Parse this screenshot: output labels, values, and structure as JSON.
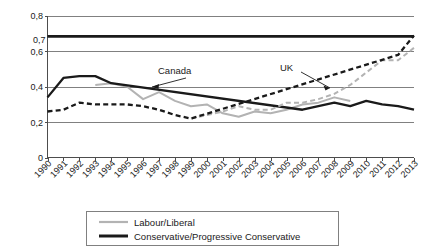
{
  "chart_data": {
    "type": "line",
    "title": "",
    "subtitle": "",
    "xlabel": "",
    "ylabel": "",
    "ylim": [
      0,
      0.8
    ],
    "xlim": [
      1990,
      2013
    ],
    "grid": true,
    "y_ticks": [
      "0",
      "0,2",
      "0,4",
      "0,6",
      "0,8"
    ],
    "y_tick_values": [
      0,
      0.2,
      0.4,
      0.6,
      0.8
    ],
    "categories": [
      "1990",
      "1991",
      "1992",
      "1993",
      "1994",
      "1995",
      "1996",
      "1997",
      "1998",
      "1999",
      "2000",
      "2001",
      "2002",
      "2003",
      "2004",
      "2005",
      "2006",
      "2007",
      "2008",
      "2009",
      "2010",
      "2011",
      "2012",
      "2013"
    ],
    "legend_position": "bottom",
    "legend": [
      {
        "label": "Labour/Liberal",
        "color": "#b3b3b3",
        "dash": "none"
      },
      {
        "label": "Conservative/Progressive Conservative",
        "color": "#1a1a1a",
        "dash": "none"
      }
    ],
    "annotations": [
      {
        "text": "Canada",
        "target_year": 2000,
        "target_value": 0.4
      },
      {
        "text": "UK",
        "target_year": 2008,
        "target_value": 0.35
      },
      {
        "text": "0,7",
        "target_year": 1990,
        "target_value": 0.69
      }
    ],
    "series": [
      {
        "name": "Canada Labour/Liberal",
        "country": "Canada",
        "party": "Labour/Liberal",
        "color": "#b3b3b3",
        "dash": "none",
        "x": [
          1993,
          1994,
          1995,
          1996,
          1997,
          1998,
          1999,
          2000,
          2001,
          2002,
          2003,
          2004,
          2005,
          2006,
          2007,
          2008,
          2009
        ],
        "values": [
          0.41,
          0.42,
          0.4,
          0.33,
          0.37,
          0.32,
          0.29,
          0.3,
          0.25,
          0.23,
          0.26,
          0.25,
          0.27,
          0.3,
          0.31,
          0.34,
          0.32
        ]
      },
      {
        "name": "Canada Conservative/Progressive Conservative",
        "country": "Canada",
        "party": "Conservative/Progressive Conservative",
        "color": "#1a1a1a",
        "dash": "none",
        "x": [
          1990,
          1991,
          1992,
          1993,
          1994,
          2006,
          2007,
          2008,
          2009,
          2010,
          2011,
          2012,
          2013
        ],
        "values": [
          0.34,
          0.45,
          0.46,
          0.46,
          0.42,
          0.27,
          0.29,
          0.31,
          0.29,
          0.32,
          0.3,
          0.29,
          0.27
        ]
      },
      {
        "name": "UK Labour/Liberal",
        "country": "UK",
        "party": "Labour/Liberal",
        "color": "#b3b3b3",
        "dash": "dashed",
        "x": [
          1999,
          2000,
          2001,
          2002,
          2003,
          2004,
          2005,
          2006,
          2007,
          2008,
          2009,
          2010,
          2011,
          2012,
          2013
        ],
        "values": [
          0.22,
          0.24,
          0.26,
          0.29,
          0.27,
          0.27,
          0.31,
          0.31,
          0.33,
          0.36,
          0.41,
          0.48,
          0.55,
          0.55,
          0.62
        ]
      },
      {
        "name": "UK Conservative/Progressive Conservative",
        "country": "UK",
        "party": "Conservative/Progressive Conservative",
        "color": "#1a1a1a",
        "dash": "dashed",
        "x": [
          1990,
          1991,
          1992,
          1993,
          1994,
          1995,
          1996,
          1997,
          1998,
          1999,
          2012,
          2013
        ],
        "values": [
          0.26,
          0.27,
          0.31,
          0.3,
          0.3,
          0.3,
          0.29,
          0.27,
          0.24,
          0.22,
          0.58,
          0.69
        ]
      },
      {
        "name": "Reference line 0,7",
        "country": "",
        "party": "reference",
        "color": "#1a1a1a",
        "dash": "none",
        "x": [
          1990,
          2013
        ],
        "values": [
          0.685,
          0.685
        ]
      }
    ]
  }
}
